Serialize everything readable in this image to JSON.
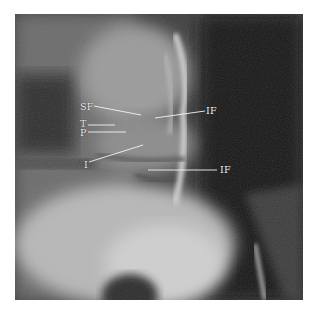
{
  "figure": {
    "type": "radiograph",
    "labels": [
      {
        "id": "sf",
        "text": "SF",
        "x": 80,
        "y": 103,
        "line": [
          94,
          106,
          141,
          115
        ]
      },
      {
        "id": "if_upper",
        "text": "IF",
        "x": 206,
        "y": 106,
        "line": [
          155,
          118,
          205,
          111
        ]
      },
      {
        "id": "t",
        "text": "T",
        "x": 80,
        "y": 118,
        "line": [
          88,
          125,
          115,
          125
        ]
      },
      {
        "id": "p",
        "text": "P",
        "x": 80,
        "y": 127,
        "line": [
          88,
          132,
          126,
          132
        ]
      },
      {
        "id": "i",
        "text": "I",
        "x": 84,
        "y": 161,
        "line": [
          89,
          162,
          143,
          145
        ]
      },
      {
        "id": "if_lower",
        "text": "IF",
        "x": 220,
        "y": 165,
        "line": [
          148,
          170,
          217,
          170
        ]
      }
    ],
    "colors": {
      "border": "#ffffff",
      "label": "#f4f4f4",
      "dark": "#151515",
      "bone": "#d8d8d8"
    }
  }
}
